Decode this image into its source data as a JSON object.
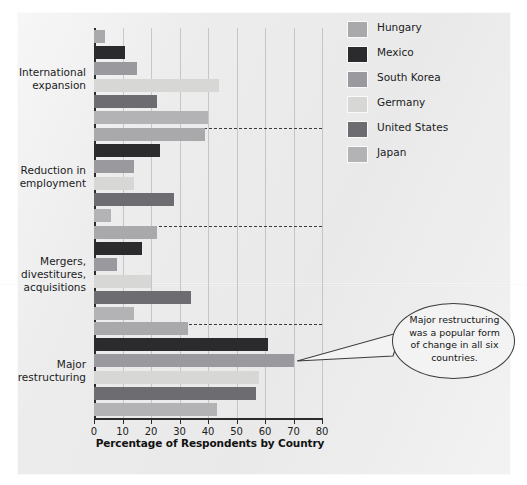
{
  "chart_data": {
    "type": "bar",
    "orientation": "horizontal",
    "title": "",
    "xlabel": "Percentage of Respondents by Country",
    "ylabel": "",
    "xlim": [
      0,
      80
    ],
    "xticks": [
      0,
      10,
      20,
      30,
      40,
      50,
      60,
      70,
      80
    ],
    "xtick_labels": [
      "0",
      "10",
      "20",
      "30",
      "40",
      "50",
      "60",
      "70",
      "80"
    ],
    "grid": true,
    "legend_position": "upper right",
    "categories": [
      "International expansion",
      "Reduction in employment",
      "Mergers, divestitures, acquisitions",
      "Major restructuring"
    ],
    "category_label_lines": [
      [
        "International",
        "expansion"
      ],
      [
        "Reduction in",
        "employment"
      ],
      [
        "Mergers,",
        "divestitures,",
        "acquisitions"
      ],
      [
        "Major",
        "restructuring"
      ]
    ],
    "series": [
      {
        "name": "Hungary",
        "color": "#a9a9ac",
        "values": [
          4,
          39,
          22,
          33
        ]
      },
      {
        "name": "Mexico",
        "color": "#2b2b2e",
        "values": [
          11,
          23,
          17,
          61
        ]
      },
      {
        "name": "South Korea",
        "color": "#9a9a9e",
        "values": [
          15,
          14,
          8,
          70
        ]
      },
      {
        "name": "Germany",
        "color": "#d7d7d6",
        "values": [
          44,
          14,
          20,
          58
        ]
      },
      {
        "name": "United States",
        "color": "#6d6d71",
        "values": [
          22,
          28,
          34,
          57
        ]
      },
      {
        "name": "Japan",
        "color": "#b3b3b6",
        "values": [
          40,
          6,
          14,
          43
        ]
      }
    ]
  },
  "legend": {
    "items": [
      {
        "label": "Hungary",
        "color": "#a9a9ac"
      },
      {
        "label": "Mexico",
        "color": "#2b2b2e"
      },
      {
        "label": "South Korea",
        "color": "#9a9a9e"
      },
      {
        "label": "Germany",
        "color": "#d7d7d6"
      },
      {
        "label": "United States",
        "color": "#6d6d71"
      },
      {
        "label": "Japan",
        "color": "#b3b3b6"
      }
    ]
  },
  "callout": {
    "text": "Major restructuring was a popular form of change in all six countries.",
    "lines": [
      "Major restructuring",
      "was a popular form",
      "of change in all six",
      "countries."
    ]
  },
  "axis": {
    "x_title": "Percentage of Respondents by Country"
  }
}
